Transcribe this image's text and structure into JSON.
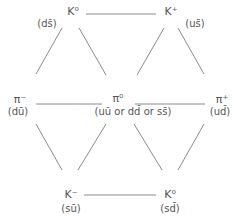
{
  "line_color": "#8a8a8a",
  "nodes": {
    "k0_top": {
      "symbol": "K⁰",
      "quarks": "(ds̄)"
    },
    "k_plus": {
      "symbol": "K⁺",
      "quarks": "(us̄)"
    },
    "pi_minus": {
      "symbol": "π⁻",
      "quarks": "(dū)"
    },
    "pi_zero": {
      "symbol": "π⁰",
      "quarks": "(uū or dd̄ or ss̄)"
    },
    "pi_plus": {
      "symbol": "π⁺",
      "quarks": "(ud̄)"
    },
    "k_minus": {
      "symbol": "K⁻",
      "quarks": "(sū)"
    },
    "k0_bottom": {
      "symbol": "K⁰",
      "quarks": "(sd̄)"
    }
  }
}
